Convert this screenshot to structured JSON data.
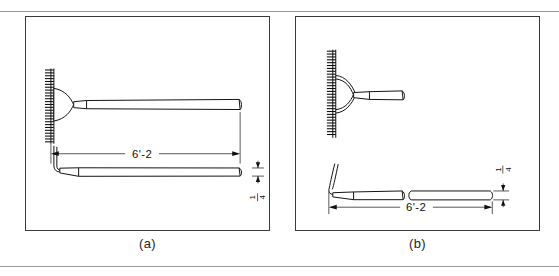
{
  "figure": {
    "type": "engineering-drawing",
    "panels": [
      {
        "id": "a",
        "caption": "(a)",
        "views": [
          "front view with rake head and handle",
          "side view of rake and handle"
        ],
        "dimensions": [
          {
            "name": "overall-length",
            "label": "6'-2",
            "orientation": "horizontal"
          },
          {
            "name": "handle-thickness",
            "label": "1/4",
            "numerator": "1",
            "denominator": "4",
            "orientation": "vertical"
          }
        ],
        "features": {
          "tine_count": 26,
          "head_shape": "fan-shaped bracket",
          "handle": "tapered straight handle"
        }
      },
      {
        "id": "b",
        "caption": "(b)",
        "views": [
          "top view with rake head and handle",
          "side view with break line"
        ],
        "dimensions": [
          {
            "name": "overall-length",
            "label": "6'-2",
            "orientation": "horizontal"
          },
          {
            "name": "handle-thickness",
            "label": "1/4",
            "numerator": "1",
            "denominator": "4",
            "orientation": "vertical"
          }
        ],
        "features": {
          "tine_count": 30,
          "head_shape": "twin curved braces",
          "handle": "tapered handle with break line"
        }
      }
    ],
    "colors": {
      "line": "#111111",
      "frame": "#3a3a3a",
      "rule": "#9a9a9a",
      "background": "#ffffff"
    }
  }
}
